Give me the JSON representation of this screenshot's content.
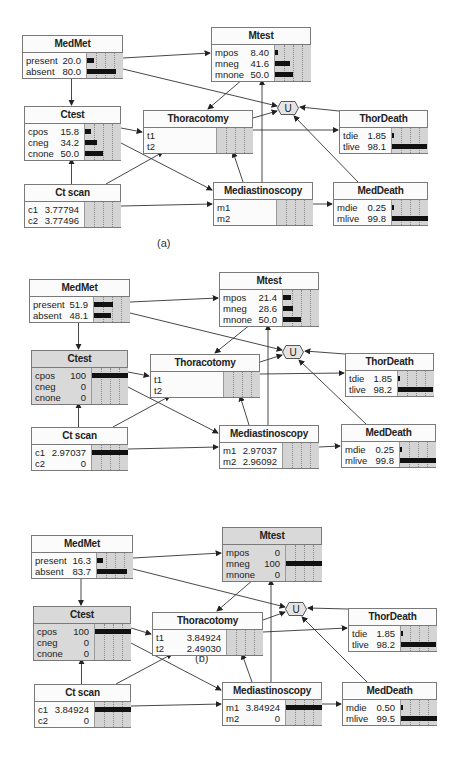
{
  "panels": [
    {
      "caption": "(a)",
      "nodes": {
        "medmet": {
          "title": "MedMet",
          "shaded": false,
          "states": [
            {
              "label": "present",
              "value": "20.0",
              "pct": 20.0
            },
            {
              "label": "absent",
              "value": "80.0",
              "pct": 80.0
            }
          ]
        },
        "mtest": {
          "title": "Mtest",
          "shaded": false,
          "states": [
            {
              "label": "mpos",
              "value": "8.40",
              "pct": 8.4
            },
            {
              "label": "mneg",
              "value": "41.6",
              "pct": 41.6
            },
            {
              "label": "mnone",
              "value": "50.0",
              "pct": 50.0
            }
          ]
        },
        "ctest": {
          "title": "Ctest",
          "shaded": false,
          "states": [
            {
              "label": "cpos",
              "value": "15.8",
              "pct": 15.8
            },
            {
              "label": "cneg",
              "value": "34.2",
              "pct": 34.2
            },
            {
              "label": "cnone",
              "value": "50.0",
              "pct": 50.0
            }
          ]
        },
        "thoracotomy": {
          "title": "Thoracotomy",
          "shaded": false,
          "states": [
            {
              "label": "t1",
              "value": "",
              "pct": 0
            },
            {
              "label": "t2",
              "value": "",
              "pct": 0
            }
          ]
        },
        "thordeath": {
          "title": "ThorDeath",
          "shaded": false,
          "states": [
            {
              "label": "tdie",
              "value": "1.85",
              "pct": 1.85
            },
            {
              "label": "tlive",
              "value": "98.1",
              "pct": 98.1
            }
          ]
        },
        "ctscan": {
          "title": "Ct scan",
          "shaded": false,
          "states": [
            {
              "label": "c1",
              "value": "3.77794",
              "pct": 0
            },
            {
              "label": "c2",
              "value": "3.77496",
              "pct": 0
            }
          ]
        },
        "mediastinoscopy": {
          "title": "Mediastinoscopy",
          "shaded": false,
          "states": [
            {
              "label": "m1",
              "value": "",
              "pct": 0
            },
            {
              "label": "m2",
              "value": "",
              "pct": 0
            }
          ]
        },
        "meddeath": {
          "title": "MedDeath",
          "shaded": false,
          "states": [
            {
              "label": "mdie",
              "value": "0.25",
              "pct": 0.25
            },
            {
              "label": "mlive",
              "value": "99.8",
              "pct": 99.8
            }
          ]
        },
        "utility": {
          "label": "U"
        }
      }
    },
    {
      "caption": "(b)",
      "nodes": {
        "medmet": {
          "title": "MedMet",
          "shaded": false,
          "states": [
            {
              "label": "present",
              "value": "51.9",
              "pct": 51.9
            },
            {
              "label": "absent",
              "value": "48.1",
              "pct": 48.1
            }
          ]
        },
        "mtest": {
          "title": "Mtest",
          "shaded": false,
          "states": [
            {
              "label": "mpos",
              "value": "21.4",
              "pct": 21.4
            },
            {
              "label": "mneg",
              "value": "28.6",
              "pct": 28.6
            },
            {
              "label": "mnone",
              "value": "50.0",
              "pct": 50.0
            }
          ]
        },
        "ctest": {
          "title": "Ctest",
          "shaded": true,
          "states": [
            {
              "label": "cpos",
              "value": "100",
              "pct": 100
            },
            {
              "label": "cneg",
              "value": "0",
              "pct": 0
            },
            {
              "label": "cnone",
              "value": "0",
              "pct": 0
            }
          ]
        },
        "thoracotomy": {
          "title": "Thoracotomy",
          "shaded": false,
          "states": [
            {
              "label": "t1",
              "value": "",
              "pct": 0
            },
            {
              "label": "t2",
              "value": "",
              "pct": 0
            }
          ]
        },
        "thordeath": {
          "title": "ThorDeath",
          "shaded": false,
          "states": [
            {
              "label": "tdie",
              "value": "1.85",
              "pct": 1.85
            },
            {
              "label": "tlive",
              "value": "98.2",
              "pct": 98.2
            }
          ]
        },
        "ctscan": {
          "title": "Ct scan",
          "shaded": false,
          "states": [
            {
              "label": "c1",
              "value": "2.97037",
              "pct": 100
            },
            {
              "label": "c2",
              "value": "0",
              "pct": 0
            }
          ]
        },
        "mediastinoscopy": {
          "title": "Mediastinoscopy",
          "shaded": false,
          "states": [
            {
              "label": "m1",
              "value": "2.97037",
              "pct": 0
            },
            {
              "label": "m2",
              "value": "2.96092",
              "pct": 0
            }
          ]
        },
        "meddeath": {
          "title": "MedDeath",
          "shaded": false,
          "states": [
            {
              "label": "mdie",
              "value": "0.25",
              "pct": 0.25
            },
            {
              "label": "mlive",
              "value": "99.8",
              "pct": 99.8
            }
          ]
        },
        "utility": {
          "label": "U"
        }
      }
    },
    {
      "caption": "(c)",
      "nodes": {
        "medmet": {
          "title": "MedMet",
          "shaded": false,
          "states": [
            {
              "label": "present",
              "value": "16.3",
              "pct": 16.3
            },
            {
              "label": "absent",
              "value": "83.7",
              "pct": 83.7
            }
          ]
        },
        "mtest": {
          "title": "Mtest",
          "shaded": true,
          "states": [
            {
              "label": "mpos",
              "value": "0",
              "pct": 0
            },
            {
              "label": "mneg",
              "value": "100",
              "pct": 100
            },
            {
              "label": "mnone",
              "value": "0",
              "pct": 0
            }
          ]
        },
        "ctest": {
          "title": "Ctest",
          "shaded": true,
          "states": [
            {
              "label": "cpos",
              "value": "100",
              "pct": 100
            },
            {
              "label": "cneg",
              "value": "0",
              "pct": 0
            },
            {
              "label": "cnone",
              "value": "0",
              "pct": 0
            }
          ]
        },
        "thoracotomy": {
          "title": "Thoracotomy",
          "shaded": false,
          "states": [
            {
              "label": "t1",
              "value": "3.84924",
              "pct": 0
            },
            {
              "label": "t2",
              "value": "2.49030",
              "pct": 0
            }
          ]
        },
        "thordeath": {
          "title": "ThorDeath",
          "shaded": false,
          "states": [
            {
              "label": "tdie",
              "value": "1.85",
              "pct": 1.85
            },
            {
              "label": "tlive",
              "value": "98.2",
              "pct": 98.2
            }
          ]
        },
        "ctscan": {
          "title": "Ct scan",
          "shaded": false,
          "states": [
            {
              "label": "c1",
              "value": "3.84924",
              "pct": 100
            },
            {
              "label": "c2",
              "value": "0",
              "pct": 0
            }
          ]
        },
        "mediastinoscopy": {
          "title": "Mediastinoscopy",
          "shaded": false,
          "states": [
            {
              "label": "m1",
              "value": "3.84924",
              "pct": 100
            },
            {
              "label": "m2",
              "value": "0",
              "pct": 0
            }
          ]
        },
        "meddeath": {
          "title": "MedDeath",
          "shaded": false,
          "states": [
            {
              "label": "mdie",
              "value": "0.50",
              "pct": 0.5
            },
            {
              "label": "mlive",
              "value": "99.5",
              "pct": 99.5
            }
          ]
        },
        "utility": {
          "label": "U"
        }
      }
    }
  ]
}
